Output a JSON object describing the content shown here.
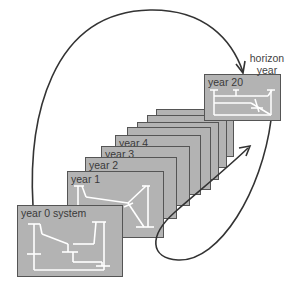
{
  "diagram": {
    "type": "planning-horizon-diagram",
    "annotation": {
      "line1": "horizon",
      "line2": "year"
    },
    "frames": [
      {
        "label": "year 0 system",
        "role": "initial-system"
      },
      {
        "label": "year 1"
      },
      {
        "label": "year 2"
      },
      {
        "label": "year 3"
      },
      {
        "label": "year 4"
      },
      {
        "label": ""
      },
      {
        "label": ""
      },
      {
        "label": ""
      },
      {
        "label": ""
      },
      {
        "label": "year 20",
        "role": "horizon-year"
      }
    ],
    "arrows": [
      {
        "from": "year 0 system",
        "to": "year 20",
        "style": "arc-over-top"
      },
      {
        "from": "year 20",
        "to": "stacked intermediate years",
        "style": "loop-back-under"
      }
    ],
    "colors": {
      "frame_fill": "#b3b3b3",
      "frame_border": "#555555",
      "network_lines": "#ffffff",
      "arrow": "#333333",
      "text": "#3a3a3a"
    }
  }
}
